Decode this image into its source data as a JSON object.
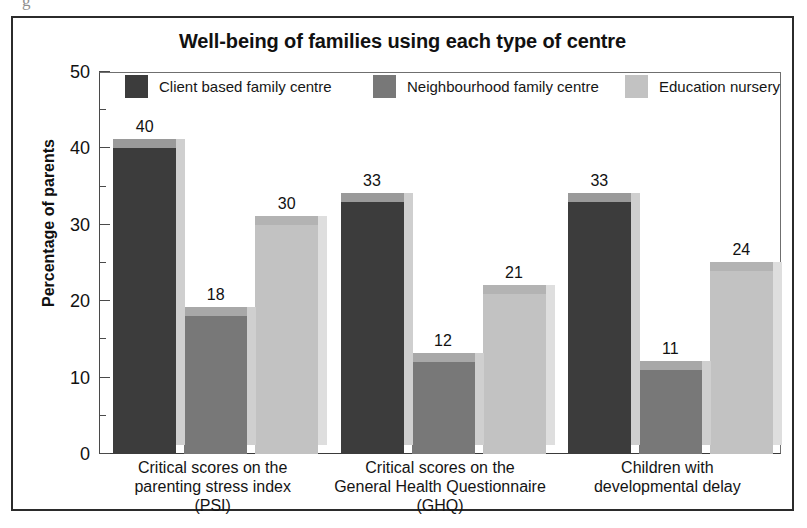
{
  "figure": {
    "stray_glyph": "g",
    "title": "Well-being of families using each type of centre"
  },
  "chart_data": {
    "type": "bar",
    "title": "Well-being of families using each type of centre",
    "xlabel": "",
    "ylabel": "Percentage of parents",
    "ylim": [
      0,
      50
    ],
    "ytick_labels": [
      "0",
      "10",
      "20",
      "30",
      "40",
      "50"
    ],
    "ytick_values": [
      0,
      10,
      20,
      30,
      40,
      50
    ],
    "minor_tick_values": [
      5,
      15,
      25,
      35,
      45
    ],
    "grid": false,
    "legend_position": "top-inside",
    "categories": [
      "Critical scores on the parenting stress index (PSI)",
      "Critical scores on the General Health Questionnaire (GHQ)",
      "Children with developmental delay"
    ],
    "category_lines": [
      [
        "Critical scores on the",
        "parenting stress index",
        "(PSI)"
      ],
      [
        "Critical scores on the",
        "General Health Questionnaire",
        "(GHQ)"
      ],
      [
        "Children with",
        "developmental delay"
      ]
    ],
    "series": [
      {
        "name": "Client based family centre",
        "color": "#3c3c3c",
        "side_color": "#cfcfcf",
        "top_color": "#9a9a9a",
        "values": [
          40,
          33,
          33
        ]
      },
      {
        "name": "Neighbourhood family centre",
        "color": "#787878",
        "side_color": "#cfcfcf",
        "top_color": "#a8a8a8",
        "values": [
          18,
          12,
          11
        ]
      },
      {
        "name": "Education nursery",
        "color": "#c2c2c2",
        "side_color": "#dedede",
        "top_color": "#b3b3b3",
        "values": [
          30,
          21,
          24
        ]
      }
    ]
  }
}
